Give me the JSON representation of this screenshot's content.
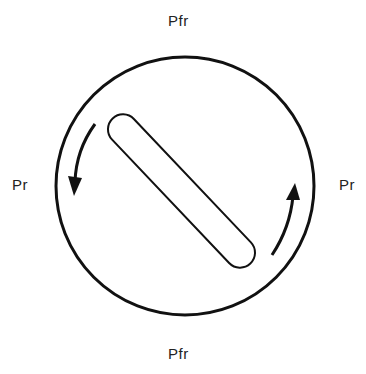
{
  "labels": {
    "top": "Pfr",
    "bottom": "Pfr",
    "left": "Pr",
    "right": "Pr"
  },
  "colors": {
    "stroke": "#111111",
    "text": "#222222",
    "background": "#ffffff"
  },
  "shapes": {
    "outer_circle": {
      "cx": 185,
      "cy": 186,
      "r": 129
    },
    "rod": {
      "x1": 116,
      "y1": 122,
      "x2": 247,
      "y2": 260,
      "width": 30
    },
    "arrows": [
      {
        "name": "left-arrow",
        "direction": "counterclockwise-down"
      },
      {
        "name": "right-arrow",
        "direction": "counterclockwise-up"
      }
    ]
  }
}
